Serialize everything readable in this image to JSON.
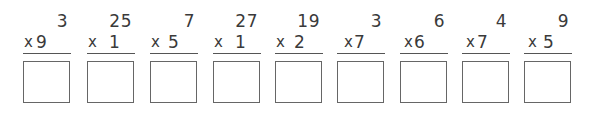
{
  "worksheet": {
    "problems": [
      {
        "top": "3",
        "operator": "x",
        "bottom": "9",
        "gap": ""
      },
      {
        "top": "25",
        "operator": "x",
        "bottom": "1",
        "gap": "  "
      },
      {
        "top": "7",
        "operator": "x",
        "bottom": "5",
        "gap": " "
      },
      {
        "top": "27",
        "operator": "x",
        "bottom": "1",
        "gap": "  "
      },
      {
        "top": "19",
        "operator": "x",
        "bottom": "2",
        "gap": " "
      },
      {
        "top": "3",
        "operator": "x",
        "bottom": "7",
        "gap": ""
      },
      {
        "top": "6",
        "operator": "x",
        "bottom": "6",
        "gap": ""
      },
      {
        "top": "4",
        "operator": "x",
        "bottom": "7",
        "gap": ""
      },
      {
        "top": "9",
        "operator": "x",
        "bottom": "5",
        "gap": " "
      }
    ],
    "answer_boxes": [
      "",
      "",
      "",
      "",
      "",
      "",
      "",
      "",
      ""
    ]
  }
}
